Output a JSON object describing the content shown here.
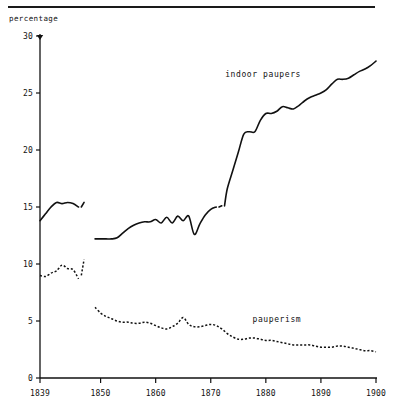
{
  "figure": {
    "y_axis_caption": "percentage",
    "rule_present": true
  },
  "chart_data": {
    "type": "line",
    "title": "",
    "subtitle": "",
    "xlabel": "",
    "ylabel": "percentage",
    "xlim": [
      1839,
      1900
    ],
    "ylim": [
      0,
      30
    ],
    "grid": false,
    "legend_position": "inline-annotation",
    "xticks": [
      1839,
      1850,
      1860,
      1870,
      1880,
      1890,
      1900
    ],
    "xtick_labels": [
      "1839",
      "1850",
      "1860",
      "1870",
      "1880",
      "1890",
      "1900"
    ],
    "yticks": [
      0,
      5,
      10,
      15,
      20,
      25,
      30
    ],
    "ytick_labels": [
      "0",
      "5",
      "10",
      "15",
      "20",
      "25",
      "30"
    ],
    "annotations": [
      {
        "text": "indoor paupers",
        "x": 1879.5,
        "y": 26.4
      },
      {
        "text": "pauperism",
        "x": 1882.0,
        "y": 4.9
      }
    ],
    "series": [
      {
        "name": "indoor paupers",
        "style": "solid",
        "color": "#111111",
        "segments": [
          {
            "x": [
              1839,
              1840,
              1841,
              1842,
              1843,
              1844,
              1845,
              1846
            ],
            "y": [
              13.8,
              14.4,
              15.0,
              15.4,
              15.3,
              15.4,
              15.3,
              15.0
            ]
          },
          {
            "x": [
              1846.5,
              1847
            ],
            "y": [
              15.0,
              15.4
            ]
          },
          {
            "x": [
              1849,
              1850,
              1851,
              1852,
              1853,
              1854,
              1855,
              1856,
              1857,
              1858,
              1859,
              1860,
              1861,
              1862,
              1863,
              1864,
              1865,
              1866,
              1867,
              1868,
              1869,
              1870,
              1871
            ],
            "y": [
              12.2,
              12.2,
              12.2,
              12.2,
              12.3,
              12.7,
              13.1,
              13.4,
              13.6,
              13.7,
              13.7,
              13.9,
              13.6,
              14.1,
              13.6,
              14.2,
              13.8,
              14.2,
              12.6,
              13.5,
              14.3,
              14.8,
              15.0
            ]
          },
          {
            "x": [
              1871.5,
              1872
            ],
            "y": [
              15.0,
              15.1
            ]
          },
          {
            "x": [
              1872.5,
              1873,
              1874,
              1875,
              1876,
              1877,
              1878,
              1879,
              1880,
              1881,
              1882,
              1883,
              1884,
              1885,
              1886,
              1887,
              1888,
              1889,
              1890,
              1891,
              1892,
              1893,
              1894,
              1895,
              1896,
              1897,
              1898,
              1899,
              1900
            ],
            "y": [
              15.1,
              16.6,
              18.2,
              19.8,
              21.4,
              21.6,
              21.6,
              22.6,
              23.2,
              23.2,
              23.4,
              23.8,
              23.7,
              23.6,
              23.9,
              24.3,
              24.6,
              24.8,
              25.0,
              25.3,
              25.8,
              26.2,
              26.2,
              26.3,
              26.6,
              26.9,
              27.1,
              27.4,
              27.8
            ]
          }
        ]
      },
      {
        "name": "pauperism",
        "style": "dotted",
        "color": "#111111",
        "segments": [
          {
            "x": [
              1839,
              1840,
              1841,
              1842,
              1843,
              1844,
              1845,
              1846
            ],
            "y": [
              9.0,
              8.9,
              9.2,
              9.4,
              9.9,
              9.6,
              9.5,
              8.7
            ]
          },
          {
            "x": [
              1846.5,
              1847
            ],
            "y": [
              9.0,
              10.4
            ]
          },
          {
            "x": [
              1849,
              1850,
              1851,
              1852,
              1853,
              1854,
              1855,
              1856,
              1857,
              1858,
              1859,
              1860,
              1861,
              1862,
              1863,
              1864,
              1865,
              1866,
              1867,
              1868,
              1869,
              1870,
              1871,
              1872,
              1873,
              1874,
              1875,
              1876,
              1877,
              1878,
              1879,
              1880,
              1881,
              1882,
              1883,
              1884,
              1885,
              1886,
              1887,
              1888,
              1889,
              1890,
              1891,
              1892,
              1893,
              1894,
              1895,
              1896,
              1897,
              1898,
              1899,
              1900
            ],
            "y": [
              6.2,
              5.7,
              5.4,
              5.2,
              5.0,
              4.9,
              4.9,
              4.8,
              4.8,
              4.9,
              4.8,
              4.6,
              4.4,
              4.3,
              4.5,
              4.8,
              5.3,
              4.7,
              4.5,
              4.5,
              4.6,
              4.7,
              4.6,
              4.3,
              3.9,
              3.6,
              3.4,
              3.4,
              3.5,
              3.5,
              3.4,
              3.3,
              3.3,
              3.2,
              3.1,
              3.0,
              2.9,
              2.9,
              2.9,
              2.9,
              2.8,
              2.7,
              2.7,
              2.7,
              2.8,
              2.8,
              2.7,
              2.6,
              2.5,
              2.4,
              2.4,
              2.3
            ]
          }
        ]
      }
    ]
  }
}
